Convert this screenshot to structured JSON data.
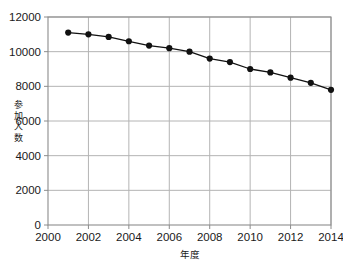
{
  "chart_data": {
    "type": "line",
    "title": "",
    "xlabel": "年度",
    "ylabel": "参加人数",
    "ylabel_chars": [
      "参",
      "加",
      "人",
      "数"
    ],
    "x": [
      2001,
      2002,
      2003,
      2004,
      2005,
      2006,
      2007,
      2008,
      2009,
      2010,
      2011,
      2012,
      2013,
      2014
    ],
    "values": [
      11100,
      11000,
      10850,
      10600,
      10350,
      10200,
      10000,
      9600,
      9400,
      9000,
      8800,
      8500,
      8200,
      7800
    ],
    "series": [
      {
        "name": "参加人数",
        "values": [
          11100,
          11000,
          10850,
          10600,
          10350,
          10200,
          10000,
          9600,
          9400,
          9000,
          8800,
          8500,
          8200,
          7800
        ]
      }
    ],
    "xlim": [
      2000,
      2014
    ],
    "ylim": [
      0,
      12000
    ],
    "xticks": [
      2000,
      2002,
      2004,
      2006,
      2008,
      2010,
      2012,
      2014
    ],
    "xtick_labels": [
      "2000",
      "2002",
      "2004",
      "2006",
      "2008",
      "2010",
      "2012",
      "2014"
    ],
    "yticks": [
      0,
      2000,
      4000,
      6000,
      8000,
      10000,
      12000
    ],
    "ytick_labels": [
      "0",
      "2000",
      "4000",
      "6000",
      "8000",
      "10000",
      "12000"
    ],
    "grid": true,
    "grid_axis": "both",
    "legend": false,
    "legend_position": "none",
    "marker": "circle",
    "marker_color": "#111111",
    "line_color": "#111111",
    "grid_color": "#b4b4b4",
    "frame_color": "#8c8c8c",
    "background": "#ffffff"
  }
}
